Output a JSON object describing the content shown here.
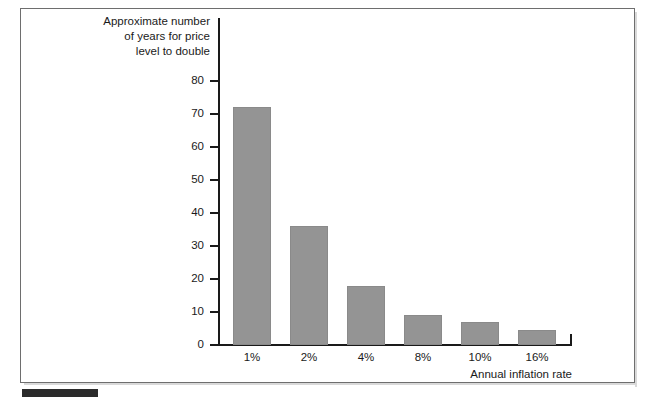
{
  "figure": {
    "title_lines": "Approximate number\nof years for price\nlevel to double",
    "bottom_marker_label": ""
  },
  "chart_data": {
    "type": "bar",
    "title": "Approximate number of years for price level to double",
    "xlabel": "Annual inflation rate",
    "ylabel": "Approximate number of years for price level to double",
    "categories": [
      "1%",
      "2%",
      "4%",
      "8%",
      "10%",
      "16%"
    ],
    "values": [
      72,
      36,
      18,
      9,
      7,
      4.5
    ],
    "ylim": [
      0,
      80
    ],
    "yticks": [
      0,
      10,
      20,
      30,
      40,
      50,
      60,
      70,
      80
    ],
    "ytick_labels": [
      "0",
      "10",
      "20",
      "30",
      "40",
      "50",
      "60",
      "70",
      "80"
    ],
    "grid": false,
    "legend": null,
    "bar_color": "#949494",
    "axis_color": "#1a1a1a",
    "background": "#ffffff"
  },
  "colors": {
    "bar_fill": "#949494",
    "axis": "#1a1a1a",
    "frame_border": "#6e6e6e",
    "marker": "#2b2b2b",
    "page_background": "#ffffff"
  }
}
